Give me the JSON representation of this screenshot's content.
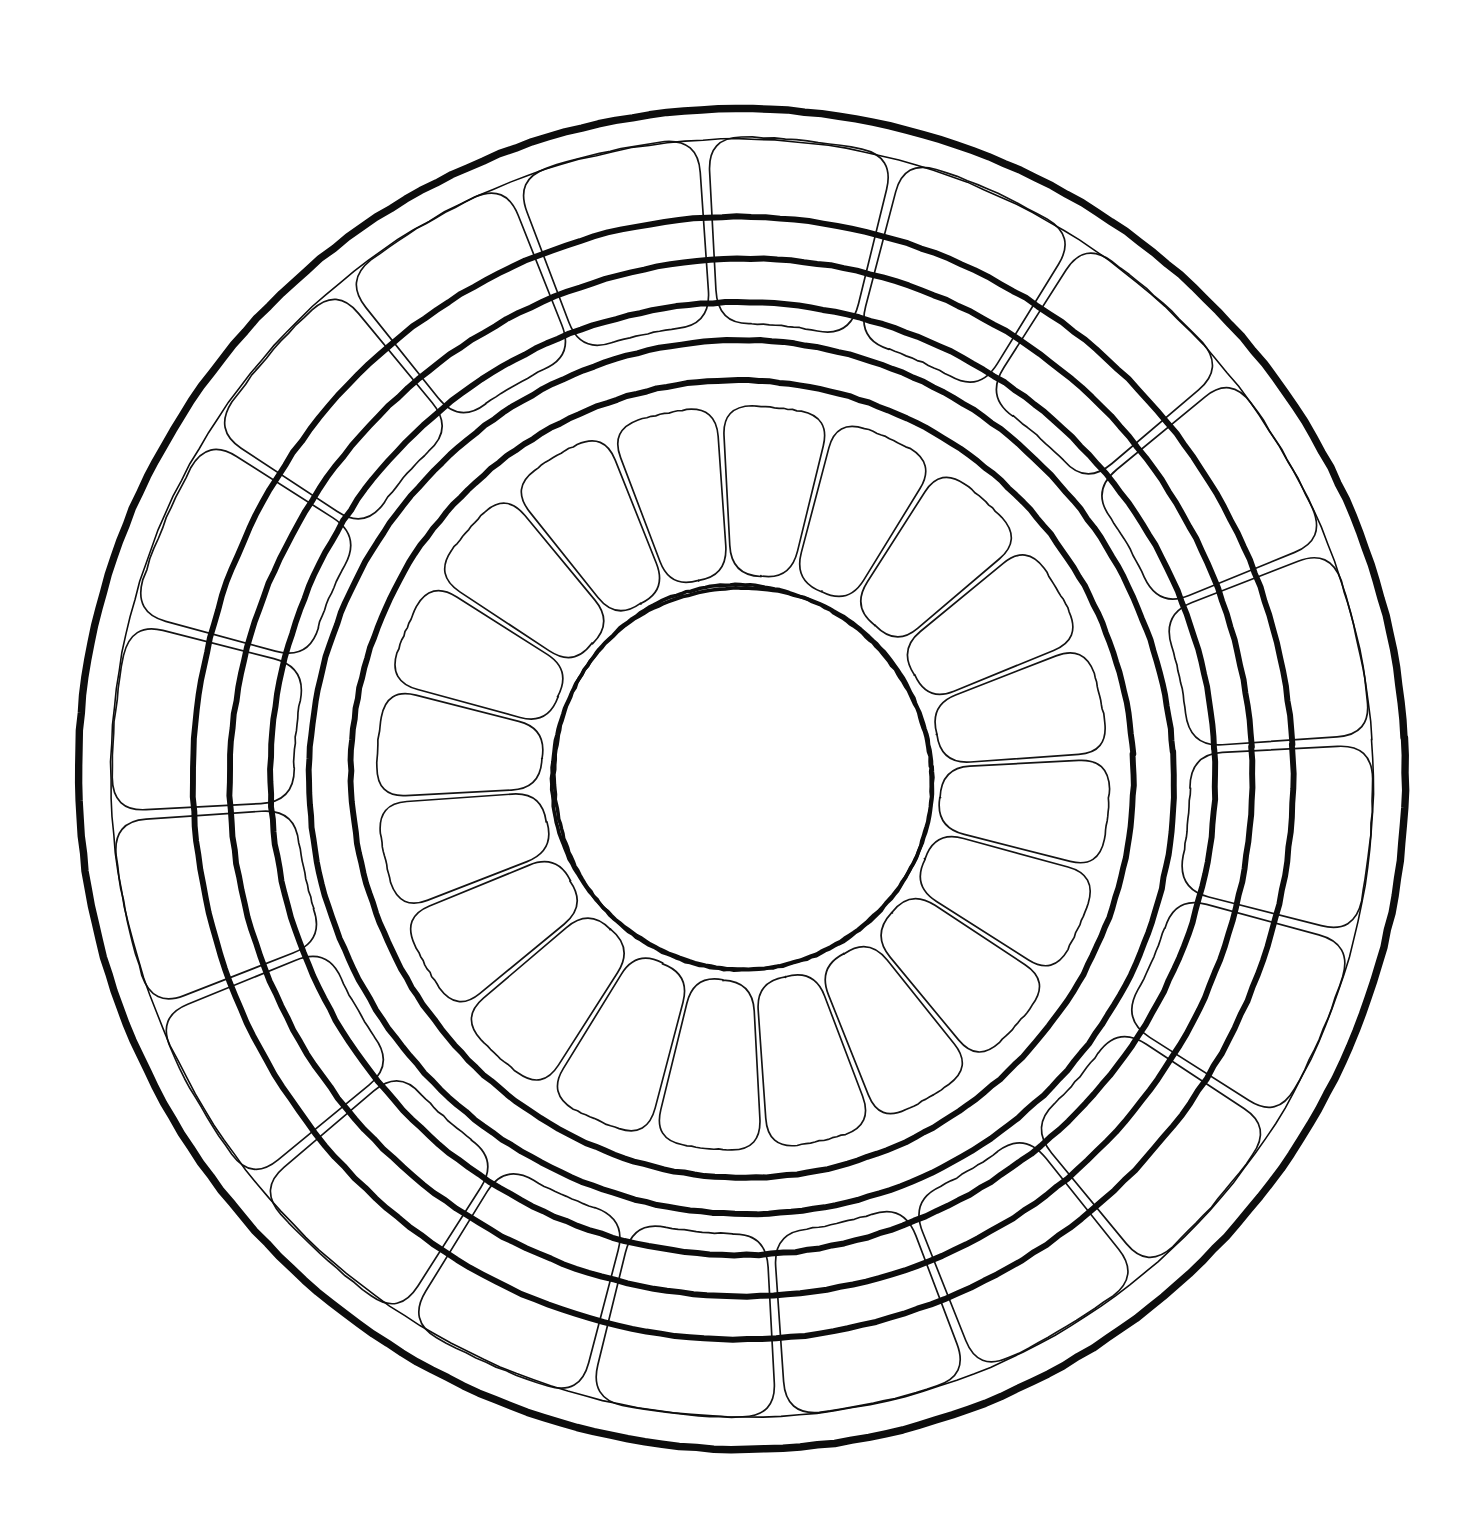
{
  "figure": {
    "background_color": "#ffffff",
    "ink_color": "#0d0d0d",
    "canvas": {
      "width": 1470,
      "height": 1536
    }
  },
  "geometry": {
    "center": {
      "x": 742,
      "y": 778
    },
    "outer_boundary_radius": 672,
    "rotation_deg": -3.5,
    "vertical_scale": 1.0,
    "horizontal_scale": 0.985
  },
  "chart_data": {
    "type": "diagram",
    "rings": [
      {
        "name": "outer-boundary-circle",
        "radius": 672,
        "stroke_width": 7.5,
        "weight": "thick",
        "cells": 0
      },
      {
        "name": "outer-cell-ring-outer-edge",
        "radius": 640,
        "stroke_width": 1.6,
        "weight": "thin",
        "cells": 20
      },
      {
        "name": "outer-cell-ring-inner-edge",
        "radius": 455,
        "stroke_width": 1.6,
        "weight": "thin",
        "cells": 20
      },
      {
        "name": "thick-circle-1",
        "radius": 560,
        "stroke_width": 6.0,
        "weight": "thick",
        "cells": 0
      },
      {
        "name": "thick-circle-2",
        "radius": 519,
        "stroke_width": 6.0,
        "weight": "thick",
        "cells": 0
      },
      {
        "name": "thick-circle-3",
        "radius": 478,
        "stroke_width": 6.0,
        "weight": "thick",
        "cells": 0
      },
      {
        "name": "thick-circle-4",
        "radius": 438,
        "stroke_width": 6.0,
        "weight": "thick",
        "cells": 0
      },
      {
        "name": "thick-circle-5",
        "radius": 398,
        "stroke_width": 6.0,
        "weight": "thick",
        "cells": 0
      },
      {
        "name": "inner-cell-ring-outer-edge",
        "radius": 372,
        "stroke_width": 1.6,
        "weight": "thin",
        "cells": 20
      },
      {
        "name": "inner-cell-ring-inner-edge",
        "radius": 203,
        "stroke_width": 1.6,
        "weight": "thin",
        "cells": 20
      },
      {
        "name": "inner-core-circle",
        "radius": 192,
        "stroke_width": 3.6,
        "weight": "medium",
        "cells": 0
      }
    ],
    "outer_ring": {
      "label": "outer cell ring",
      "sector_count": 20,
      "inner_radius": 455,
      "outer_radius": 640,
      "corner_radius": 34,
      "gap_deg": 0.9
    },
    "inner_ring": {
      "label": "inner cell ring",
      "sector_count": 20,
      "inner_radius": 203,
      "outer_radius": 372,
      "corner_radius": 30,
      "gap_deg": 1.0
    },
    "core": {
      "label": "empty central lumen",
      "radius": 192,
      "fill": "#ffffff"
    },
    "legend": [],
    "annotations": [],
    "axis_labels": [],
    "grid": false
  },
  "labels": {
    "none_visible": ""
  }
}
